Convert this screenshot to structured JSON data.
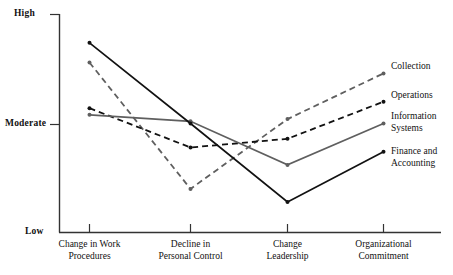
{
  "chart_data": {
    "type": "line",
    "title": "",
    "xlabel": "",
    "ylabel": "",
    "grid": false,
    "legend_position": "right-of-plot-end-labels",
    "categories": [
      "Change in Work Procedures",
      "Decline in Personal Control",
      "Change Leadership",
      "Organizational Commitment"
    ],
    "category_lines": [
      [
        "Change in Work",
        "Procedures"
      ],
      [
        "Decline in",
        "Personal Control"
      ],
      [
        "Change",
        "Leadership"
      ],
      [
        "Organizational",
        "Commitment"
      ]
    ],
    "ytick_labels": [
      "High",
      "Moderate",
      "Low"
    ],
    "ylim": [
      0,
      100
    ],
    "ytick_values": [
      100,
      50,
      0
    ],
    "series": [
      {
        "name": "Collection",
        "label_lines": [
          "Collection"
        ],
        "style": "dashed",
        "color": "#5f5f5f",
        "values": [
          78,
          20,
          52,
          73
        ]
      },
      {
        "name": "Operations",
        "label_lines": [
          "Operations"
        ],
        "style": "dashed",
        "color": "#121212",
        "values": [
          57,
          39,
          43,
          60
        ]
      },
      {
        "name": "Information Systems",
        "label_lines": [
          "Information",
          "Systems"
        ],
        "style": "solid",
        "color": "#5f5f5f",
        "values": [
          54,
          51,
          31,
          50
        ]
      },
      {
        "name": "Finance and Accounting",
        "label_lines": [
          "Finance and",
          "Accounting"
        ],
        "style": "solid",
        "color": "#121212",
        "values": [
          87,
          50,
          14,
          37
        ]
      }
    ]
  },
  "axes": {
    "y": {
      "high": "High",
      "moderate": "Moderate",
      "low": "Low"
    },
    "x": {
      "t1_line1": "Change in Work",
      "t1_line2": "Procedures",
      "t2_line1": "Decline in",
      "t2_line2": "Personal Control",
      "t3_line1": "Change",
      "t3_line2": "Leadership",
      "t4_line1": "Organizational",
      "t4_line2": "Commitment"
    }
  },
  "legend": {
    "s1_line1": "Collection",
    "s2_line1": "Operations",
    "s3_line1": "Information",
    "s3_line2": "Systems",
    "s4_line1": "Finance and",
    "s4_line2": "Accounting"
  },
  "colors": {
    "dark": "#121212",
    "gray": "#5f5f5f",
    "axis": "#333333",
    "background": "#ffffff"
  }
}
